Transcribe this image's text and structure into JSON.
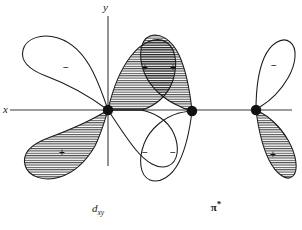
{
  "figure": {
    "background_color": "#ffffff",
    "line_color": "#1a1a1a",
    "hatch_color": "#1a1a1a"
  },
  "axes": {
    "x_label": "x",
    "y_label": "y",
    "x_axis": {
      "x1": 10,
      "y1": 110,
      "x2": 292,
      "y2": 110
    },
    "y_axis": {
      "x1": 108,
      "y1": 16,
      "x2": 108,
      "y2": 166
    }
  },
  "nuclei": [
    {
      "name": "metal-center",
      "cx": 108,
      "cy": 110,
      "r": 5.2
    },
    {
      "name": "ligand-atom-1",
      "cx": 192,
      "cy": 111,
      "r": 5.2
    },
    {
      "name": "ligand-atom-2",
      "cx": 256,
      "cy": 110,
      "r": 5.2
    }
  ],
  "lobes": [
    {
      "name": "dxy-upper-left-lobe",
      "sign": "−",
      "shaded": false,
      "sign_x": 66,
      "sign_y": 68
    },
    {
      "name": "dxy-lower-left-lobe",
      "sign": "+",
      "shaded": true,
      "sign_x": 62,
      "sign_y": 153
    },
    {
      "name": "dxy-upper-right-lobe",
      "sign": "+",
      "shaded": true,
      "sign_x": 145,
      "sign_y": 68
    },
    {
      "name": "dxy-lower-right-lobe",
      "sign": "−",
      "shaded": false,
      "sign_x": 145,
      "sign_y": 153
    },
    {
      "name": "pistar-left-upper-lobe",
      "sign": "+",
      "shaded": true,
      "sign_x": 173,
      "sign_y": 68
    },
    {
      "name": "pistar-left-lower-lobe",
      "sign": "−",
      "shaded": false,
      "sign_x": 173,
      "sign_y": 153
    },
    {
      "name": "pistar-right-upper-lobe",
      "sign": "−",
      "shaded": false,
      "sign_x": 274,
      "sign_y": 66
    },
    {
      "name": "pistar-right-lower-lobe",
      "sign": "+",
      "shaded": true,
      "sign_x": 273,
      "sign_y": 155
    }
  ],
  "captions": {
    "left": {
      "base": "d",
      "subscript": "xy",
      "x": 98,
      "y": 212
    },
    "right": {
      "base": "π",
      "superscript": "*",
      "x": 216,
      "y": 211
    }
  }
}
